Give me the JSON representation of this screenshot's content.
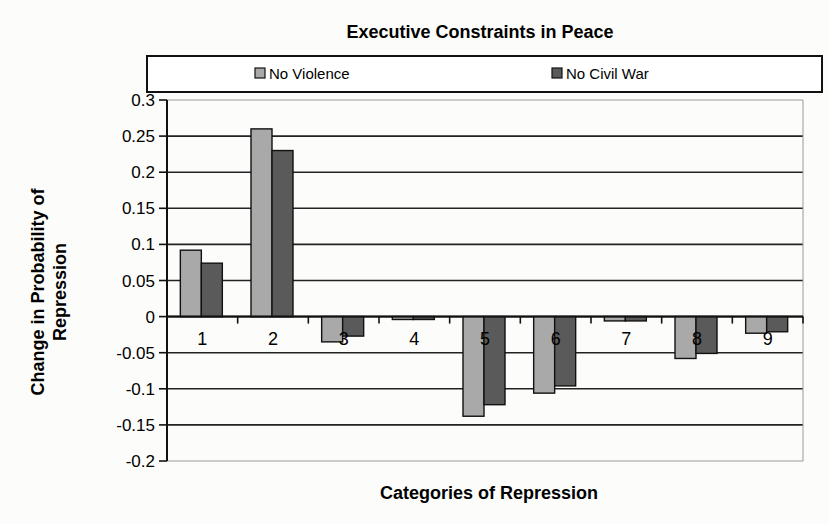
{
  "chart_data": {
    "type": "bar",
    "title": "Executive Constraints in Peace",
    "xlabel": "Categories of Repression",
    "ylabel": "Change in Probability of Repression",
    "ylabel_lines": [
      "Change in Probability of",
      "Repression"
    ],
    "categories": [
      "1",
      "2",
      "3",
      "4",
      "5",
      "6",
      "7",
      "8",
      "9"
    ],
    "series": [
      {
        "name": "No Violence",
        "color": "#a9a9a9",
        "values": [
          0.092,
          0.26,
          -0.035,
          -0.004,
          -0.138,
          -0.106,
          -0.006,
          -0.058,
          -0.023
        ]
      },
      {
        "name": "No Civil War",
        "color": "#5a5a5a",
        "values": [
          0.074,
          0.23,
          -0.027,
          -0.004,
          -0.122,
          -0.096,
          -0.006,
          -0.051,
          -0.021
        ]
      }
    ],
    "ylim": [
      -0.2,
      0.3
    ],
    "yticks": [
      0.3,
      0.25,
      0.2,
      0.15,
      0.1,
      0.05,
      0,
      -0.05,
      -0.1,
      -0.15,
      -0.2
    ],
    "ytick_labels": [
      "0.3",
      "0.25",
      "0.2",
      "0.15",
      "0.1",
      "0.05",
      "0",
      "-0.05",
      "-0.1",
      "-0.15",
      "-0.2"
    ],
    "grid": true,
    "legend_position": "top"
  }
}
